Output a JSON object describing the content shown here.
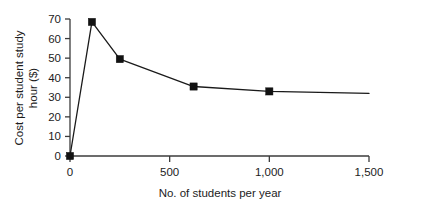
{
  "chart_data": {
    "type": "line",
    "title": "",
    "subtitle": "",
    "xlabel": "No. of students per year",
    "ylabel_line1": "Cost per student study",
    "ylabel_line2": "hour ($)",
    "ylabel": "Cost per student study hour ($)",
    "xlim": [
      0,
      1500
    ],
    "ylim": [
      0,
      70
    ],
    "grid": false,
    "legend": false,
    "legend_position": "none",
    "marker": "filled-square",
    "xticks": [
      0,
      500,
      1000,
      1500
    ],
    "xtick_labels": [
      "0",
      "500",
      "1,000",
      "1,500"
    ],
    "yticks": [
      0,
      10,
      20,
      30,
      40,
      50,
      60,
      70
    ],
    "ytick_labels": [
      "0",
      "10",
      "20",
      "30",
      "40",
      "50",
      "60",
      "70"
    ],
    "series": [
      {
        "name": "Cost per student study hour",
        "color": "#121212",
        "x": [
          0,
          110,
          250,
          620,
          1000,
          1500
        ],
        "y": [
          0,
          68.5,
          49.5,
          35.5,
          33,
          32
        ],
        "points": [
          {
            "x": 0,
            "y": 0,
            "marker": true
          },
          {
            "x": 110,
            "y": 68.5,
            "marker": true
          },
          {
            "x": 250,
            "y": 49.5,
            "marker": true
          },
          {
            "x": 620,
            "y": 35.5,
            "marker": true
          },
          {
            "x": 1000,
            "y": 33,
            "marker": true
          },
          {
            "x": 1500,
            "y": 32,
            "marker": false
          }
        ]
      }
    ],
    "colors": {
      "line": "#1a1a1a",
      "marker": "#121212",
      "axis": "#3b3b3b",
      "text": "#1c1c1c",
      "background": "#ffffff"
    }
  }
}
